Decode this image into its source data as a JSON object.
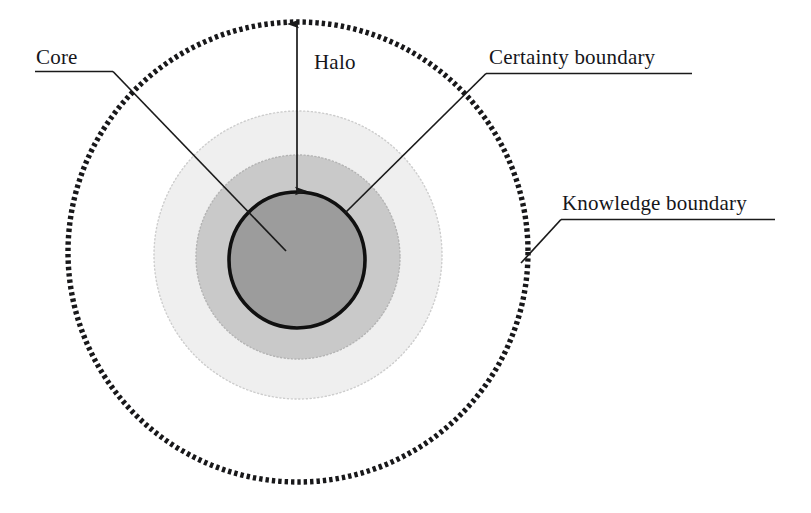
{
  "figure": {
    "kind": "concentric-circles-diagram",
    "background_color": "#ffffff",
    "labels": {
      "core": "Core",
      "halo": "Halo",
      "certainty_boundary": "Certainty boundary",
      "knowledge_boundary": "Knowledge boundary"
    },
    "regions": [
      {
        "name": "core",
        "shape": "circle",
        "center": [
          297,
          260
        ],
        "radius": 68,
        "fill_color": "#9c9c9c",
        "stroke_color": "#111111",
        "stroke_width": 3.4,
        "stroke_style": "solid"
      },
      {
        "name": "certainty-ring",
        "shape": "circle",
        "center": [
          298,
          257
        ],
        "radius": 102,
        "fill_color": "#c9c9c9",
        "stroke_color": "#bdbdbd",
        "stroke_width": 1,
        "stroke_style": "dotted"
      },
      {
        "name": "halo-ring",
        "shape": "circle",
        "center": [
          298,
          255
        ],
        "radius": 144,
        "fill_color": "#eeeeee",
        "stroke_color": "#cfcfcf",
        "stroke_width": 1,
        "stroke_style": "dotted"
      },
      {
        "name": "knowledge-ring",
        "shape": "circle",
        "center": [
          298,
          252
        ],
        "radius": 230,
        "fill_color": "none",
        "stroke_color": "#1a1a1a",
        "stroke_width": 5,
        "stroke_style": "dashed-thick"
      }
    ],
    "leaders": [
      {
        "name": "core-leader",
        "underline": {
          "x1": 35,
          "y1": 71,
          "x2": 113,
          "y2": 71
        },
        "diagonal": {
          "x1": 113,
          "y1": 71,
          "x2": 286,
          "y2": 251
        }
      },
      {
        "name": "certainty-leader",
        "underline": {
          "x1": 484,
          "y1": 73,
          "x2": 692,
          "y2": 73
        },
        "diagonal": {
          "x1": 484,
          "y1": 73,
          "x2": 345,
          "y2": 213
        }
      },
      {
        "name": "knowledge-leader",
        "underline": {
          "x1": 560,
          "y1": 219,
          "x2": 775,
          "y2": 219
        },
        "diagonal": {
          "x1": 560,
          "y1": 219,
          "x2": 521,
          "y2": 262
        }
      }
    ],
    "halo_arrow": {
      "name": "halo-double-arrow",
      "x": 297,
      "y_top": 23,
      "y_bottom": 192,
      "double_headed": true,
      "stroke_color": "#1a1a1a",
      "stroke_width": 1.6
    }
  }
}
